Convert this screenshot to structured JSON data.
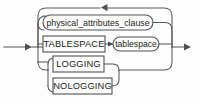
{
  "diagram": {
    "kind": "railroad-syntax-diagram",
    "canvas": {
      "width": 198,
      "height": 102
    },
    "colors": {
      "background": "#fdfdfd",
      "rail": "#55595c",
      "node_stroke": "#4f5355",
      "node_fill": "#fbfbfb",
      "text": "#1d1f20"
    },
    "entry": {
      "name": "entry-arrow",
      "direction": "right",
      "x": 4,
      "y": 47
    },
    "exit": {
      "name": "exit-arrow",
      "direction": "right",
      "x": 178,
      "y": 47
    },
    "loop_back": {
      "name": "loop-back-arrow",
      "direction": "left",
      "x": 104,
      "y": 7
    },
    "branches": [
      {
        "id": "physical-attributes-clause",
        "label": "physical_attributes_clause",
        "shape": "rounded",
        "type": "nonterminal",
        "row": 1,
        "box": {
          "x": 43,
          "y": 15,
          "width": 110,
          "height": 15
        }
      },
      {
        "id": "tablespace-keyword",
        "label": "TABLESPACE",
        "shape": "rectangle",
        "type": "keyword",
        "row": 2,
        "box": {
          "x": 43,
          "y": 36,
          "width": 62,
          "height": 16
        }
      },
      {
        "id": "tablespace-value",
        "label": "tablespace",
        "shape": "rounded",
        "type": "nonterminal",
        "row": 2,
        "box": {
          "x": 113,
          "y": 37,
          "width": 46,
          "height": 14
        }
      },
      {
        "id": "logging-keyword",
        "label": "LOGGING",
        "shape": "rectangle",
        "type": "keyword",
        "row": 3,
        "box": {
          "x": 53,
          "y": 56,
          "width": 51,
          "height": 16
        }
      },
      {
        "id": "nologging-keyword",
        "label": "NOLOGGING",
        "shape": "rectangle",
        "type": "keyword",
        "row": 4,
        "box": {
          "x": 53,
          "y": 78,
          "width": 59,
          "height": 16
        }
      }
    ]
  }
}
